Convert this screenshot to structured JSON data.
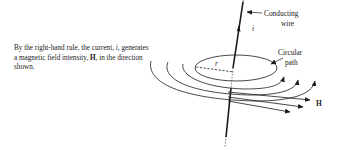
{
  "caption": {
    "part1": "By the right-hand rule, the current, ",
    "current_symbol": "i",
    "part2": ", generates a magnetic field intensity, ",
    "field_symbol": "H",
    "part3": ", in the direction shown."
  },
  "labels": {
    "conducting_line1": "Conducting",
    "conducting_line2": "wire",
    "current": "i",
    "radius": "r",
    "circular_line1": "Circular",
    "circular_line2": "path",
    "field": "H"
  },
  "colors": {
    "ink": "#1a1a1a",
    "background": "#ffffff"
  }
}
